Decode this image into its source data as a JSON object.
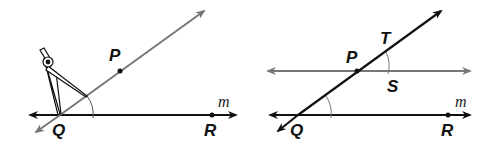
{
  "figures": [
    {
      "id": "left",
      "description": "Constructing a congruent angle with a compass at Q",
      "labels": {
        "P": "P",
        "Q": "Q",
        "R": "R",
        "m": "m"
      }
    },
    {
      "id": "right",
      "description": "Line through P parallel to m with transversal",
      "labels": {
        "P": "P",
        "T": "T",
        "S": "S",
        "Q": "Q",
        "R": "R",
        "m": "m"
      }
    }
  ],
  "colors": {
    "dark": "#111111",
    "gray": "#777777"
  }
}
